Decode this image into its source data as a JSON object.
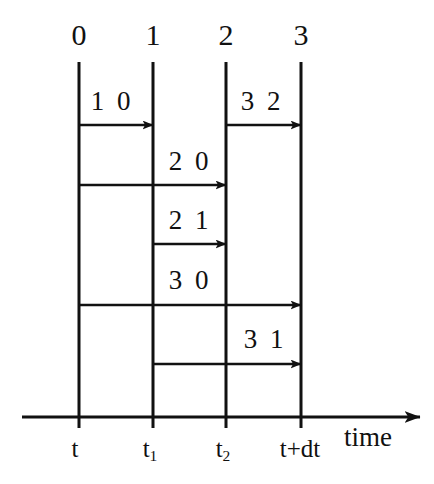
{
  "figure": {
    "kind": "message-passing-timing-diagram",
    "width": 434,
    "height": 484,
    "background_color": "#ffffff",
    "ink_color": "#111111"
  },
  "processes": [
    {
      "label": "0",
      "x": 79
    },
    {
      "label": "1",
      "x": 153
    },
    {
      "label": "2",
      "x": 226
    },
    {
      "label": "3",
      "x": 301
    }
  ],
  "process_line": {
    "top_y": 62,
    "bottom_y": 428,
    "stroke_width": 3
  },
  "process_label_y": 50,
  "messages": [
    {
      "label": "1 0",
      "from": 0,
      "to": 1,
      "y": 125,
      "label_x": 112,
      "label_y": 115
    },
    {
      "label": "3 2",
      "from": 2,
      "to": 3,
      "y": 125,
      "label_x": 262,
      "label_y": 115
    },
    {
      "label": "2 0",
      "from": 0,
      "to": 2,
      "y": 185,
      "label_x": 190,
      "label_y": 175
    },
    {
      "label": "2 1",
      "from": 1,
      "to": 2,
      "y": 244,
      "label_x": 190,
      "label_y": 234
    },
    {
      "label": "3 0",
      "from": 0,
      "to": 3,
      "y": 305,
      "label_x": 190,
      "label_y": 294
    },
    {
      "label": "3 1",
      "from": 1,
      "to": 3,
      "y": 364,
      "label_x": 265,
      "label_y": 353
    }
  ],
  "time_axis": {
    "label": "time",
    "label_x": 368,
    "label_y": 424,
    "y": 417,
    "x_start": 22,
    "x_end": 420,
    "stroke_width": 3
  },
  "time_ticks": [
    {
      "label": "t",
      "sub": "",
      "x": 75,
      "y": 436
    },
    {
      "label": "t",
      "sub": "1",
      "x": 150,
      "y": 436
    },
    {
      "label": "t",
      "sub": "2",
      "x": 223,
      "y": 436
    },
    {
      "label": "t+dt",
      "sub": "",
      "x": 300,
      "y": 436
    }
  ]
}
